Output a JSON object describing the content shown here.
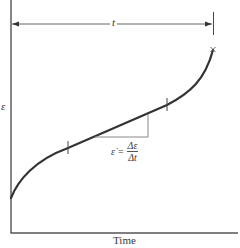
{
  "diagram": {
    "type": "creep-curve",
    "y_axis_label": "ε",
    "x_axis_label": "Time",
    "duration_label": "t",
    "rupture_marker": "×",
    "formula": {
      "lhs": "ε̇",
      "equals": "=",
      "numerator": "Δε",
      "denominator": "Δt"
    },
    "colors": {
      "curve": "#333333",
      "axis": "#444444",
      "triangle": "#888888"
    }
  }
}
